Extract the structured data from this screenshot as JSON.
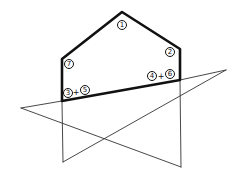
{
  "diagram": {
    "colors": {
      "stroke": "#111111",
      "thin_stroke": "#333333",
      "background": "#ffffff"
    },
    "labels": {
      "apex": "1",
      "right_shoulder": "2",
      "left_shoulder": "7",
      "bottom_left_a": "3",
      "bottom_left_plus": "+",
      "bottom_left_b": "5",
      "bottom_right_a": "4",
      "bottom_right_plus": "+",
      "bottom_right_b": "6"
    }
  }
}
